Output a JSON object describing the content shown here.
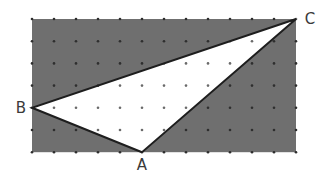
{
  "diagram": {
    "type": "geometry-grid-triangle",
    "colors": {
      "shaded_region": "#6f6f6f",
      "triangle_fill": "#ffffff",
      "edge": "#1e1e1e",
      "dot_on_shade": "#2e2e2e",
      "dot_on_white": "#6a6a6a",
      "label": "#3a3a3a"
    },
    "grid": {
      "origin_x": 32,
      "origin_y": 19,
      "spacing_x": 22,
      "spacing_y": 22.2,
      "columns": 12,
      "rows": 6
    },
    "rectangle": {
      "x0": 0,
      "y0": 0,
      "x1": 12,
      "y1": 6
    },
    "vertices": [
      {
        "name": "A",
        "gx": 5,
        "gy": 6,
        "label_dx": 0,
        "label_dy": 18,
        "anchor": "middle"
      },
      {
        "name": "B",
        "gx": 0,
        "gy": 4,
        "label_dx": -11,
        "label_dy": 5,
        "anchor": "middle"
      },
      {
        "name": "C",
        "gx": 12,
        "gy": 0,
        "label_dx": 14,
        "label_dy": 5,
        "anchor": "middle"
      }
    ],
    "labels": {
      "A": "A",
      "B": "B",
      "C": "C"
    }
  }
}
